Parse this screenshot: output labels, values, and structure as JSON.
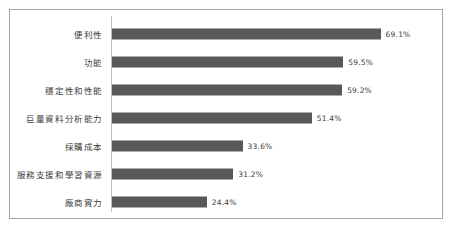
{
  "chart_data": {
    "type": "bar",
    "orientation": "horizontal",
    "title": "",
    "subtitle": "",
    "xlabel": "",
    "ylabel": "",
    "grid": false,
    "legend": false,
    "legend_position": "none",
    "value_suffix": "%",
    "xlim": [
      0,
      69.1
    ],
    "axis_max_for_scale": 71,
    "bar_color": "#595959",
    "axis_line_color": "#bfbfbf",
    "border_color": "#a6a6a6",
    "background_color": "#ffffff",
    "text_color": "#3b3b3b",
    "categories": [
      "便利性",
      "功能",
      "穩定性和性能",
      "巨量資料分析能力",
      "採購成本",
      "服務支援和學習資源",
      "廠商實力"
    ],
    "values": [
      69.1,
      59.5,
      59.2,
      51.4,
      33.6,
      31.2,
      24.4
    ],
    "value_labels": [
      "69.1%",
      "59.5%",
      "59.2%",
      "51.4%",
      "33.6%",
      "31.2%",
      "24.4%"
    ],
    "points": [
      {
        "category": "便利性",
        "value": 69.1,
        "label": "69.1%"
      },
      {
        "category": "功能",
        "value": 59.5,
        "label": "59.5%"
      },
      {
        "category": "穩定性和性能",
        "value": 59.2,
        "label": "59.2%"
      },
      {
        "category": "巨量資料分析能力",
        "value": 51.4,
        "label": "51.4%"
      },
      {
        "category": "採購成本",
        "value": 33.6,
        "label": "33.6%"
      },
      {
        "category": "服務支援和學習資源",
        "value": 31.2,
        "label": "31.2%"
      },
      {
        "category": "廠商實力",
        "value": 24.4,
        "label": "24.4%"
      }
    ]
  }
}
